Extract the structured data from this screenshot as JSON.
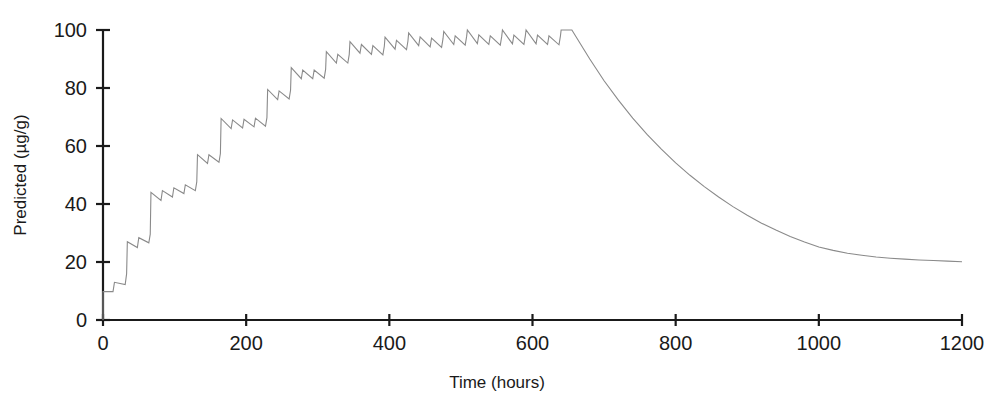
{
  "chart_data": {
    "type": "line",
    "title": "",
    "xlabel": "Time (hours)",
    "ylabel": "Predicted (µg/g)",
    "xlim": [
      0,
      1200
    ],
    "ylim": [
      0,
      100
    ],
    "xticks": [
      0,
      200,
      400,
      600,
      800,
      1000,
      1200
    ],
    "xtick_labels": [
      "0",
      "200",
      "400",
      "600",
      "800",
      "1000",
      "1200"
    ],
    "yticks": [
      0,
      20,
      40,
      60,
      80,
      100
    ],
    "ytick_labels": [
      "0",
      "20",
      "40",
      "60",
      "80",
      "100"
    ],
    "grid": false,
    "legend": "none",
    "line_color": "#8a8a8a",
    "line_width": 1.1,
    "axis_color": "#1a1a1a",
    "series": [
      {
        "name": "Predicted concentration",
        "peak_value": 100,
        "peak_time": 655,
        "initial_value": 10,
        "final_value": 20,
        "dose_interval_hours": 17,
        "points": [
          [
            0,
            0
          ],
          [
            0,
            9.8
          ],
          [
            14,
            9.8
          ],
          [
            16,
            13.0
          ],
          [
            31,
            12.2
          ],
          [
            33,
            16.0
          ],
          [
            34,
            27.0
          ],
          [
            48,
            25.0
          ],
          [
            50,
            28.4
          ],
          [
            64,
            26.6
          ],
          [
            66,
            29.6
          ],
          [
            67,
            44.0
          ],
          [
            81,
            41.2
          ],
          [
            83,
            44.6
          ],
          [
            97,
            42.4
          ],
          [
            99,
            45.6
          ],
          [
            113,
            43.6
          ],
          [
            115,
            46.6
          ],
          [
            129,
            44.6
          ],
          [
            131,
            47.6
          ],
          [
            132,
            57.0
          ],
          [
            146,
            54.0
          ],
          [
            148,
            57.0
          ],
          [
            162,
            54.4
          ],
          [
            164,
            57.4
          ],
          [
            165,
            69.5
          ],
          [
            179,
            66.0
          ],
          [
            181,
            69.0
          ],
          [
            195,
            66.2
          ],
          [
            197,
            69.2
          ],
          [
            211,
            66.6
          ],
          [
            213,
            69.6
          ],
          [
            227,
            66.8
          ],
          [
            229,
            69.8
          ],
          [
            230,
            79.5
          ],
          [
            244,
            76.0
          ],
          [
            246,
            79.0
          ],
          [
            260,
            76.2
          ],
          [
            262,
            79.2
          ],
          [
            263,
            87.0
          ],
          [
            277,
            83.2
          ],
          [
            279,
            86.2
          ],
          [
            293,
            83.2
          ],
          [
            295,
            86.2
          ],
          [
            309,
            83.4
          ],
          [
            311,
            86.4
          ],
          [
            312,
            92.5
          ],
          [
            326,
            88.6
          ],
          [
            328,
            91.6
          ],
          [
            342,
            88.6
          ],
          [
            344,
            91.6
          ],
          [
            345,
            96.0
          ],
          [
            359,
            92.0
          ],
          [
            361,
            95.0
          ],
          [
            375,
            91.6
          ],
          [
            377,
            94.6
          ],
          [
            391,
            91.4
          ],
          [
            393,
            94.4
          ],
          [
            394,
            97.5
          ],
          [
            408,
            93.4
          ],
          [
            410,
            96.4
          ],
          [
            424,
            93.2
          ],
          [
            426,
            96.2
          ],
          [
            427,
            99.0
          ],
          [
            441,
            94.6
          ],
          [
            443,
            97.6
          ],
          [
            457,
            94.2
          ],
          [
            459,
            97.2
          ],
          [
            473,
            94.0
          ],
          [
            475,
            97.0
          ],
          [
            476,
            99.5
          ],
          [
            490,
            95.0
          ],
          [
            492,
            98.0
          ],
          [
            506,
            94.8
          ],
          [
            508,
            97.8
          ],
          [
            509,
            100.0
          ],
          [
            523,
            95.3
          ],
          [
            525,
            98.3
          ],
          [
            539,
            95.0
          ],
          [
            541,
            98.0
          ],
          [
            555,
            94.8
          ],
          [
            557,
            97.8
          ],
          [
            558,
            100.0
          ],
          [
            572,
            95.2
          ],
          [
            574,
            98.2
          ],
          [
            588,
            95.0
          ],
          [
            590,
            98.0
          ],
          [
            591,
            100.0
          ],
          [
            605,
            95.2
          ],
          [
            607,
            98.2
          ],
          [
            621,
            95.0
          ],
          [
            623,
            98.0
          ],
          [
            637,
            94.9
          ],
          [
            639,
            97.9
          ],
          [
            640,
            100.0
          ],
          [
            655,
            100.0
          ],
          [
            680,
            90.0
          ],
          [
            700,
            82.5
          ],
          [
            720,
            75.8
          ],
          [
            740,
            69.6
          ],
          [
            760,
            64.0
          ],
          [
            780,
            58.9
          ],
          [
            800,
            54.2
          ],
          [
            820,
            49.9
          ],
          [
            840,
            46.0
          ],
          [
            860,
            42.4
          ],
          [
            880,
            39.1
          ],
          [
            900,
            36.1
          ],
          [
            920,
            33.4
          ],
          [
            940,
            31.0
          ],
          [
            960,
            28.8
          ],
          [
            980,
            26.9
          ],
          [
            1000,
            25.2
          ],
          [
            1020,
            24.0
          ],
          [
            1040,
            23.0
          ],
          [
            1060,
            22.3
          ],
          [
            1080,
            21.7
          ],
          [
            1100,
            21.3
          ],
          [
            1120,
            21.0
          ],
          [
            1140,
            20.7
          ],
          [
            1160,
            20.5
          ],
          [
            1180,
            20.3
          ],
          [
            1200,
            20.1
          ]
        ]
      }
    ]
  }
}
